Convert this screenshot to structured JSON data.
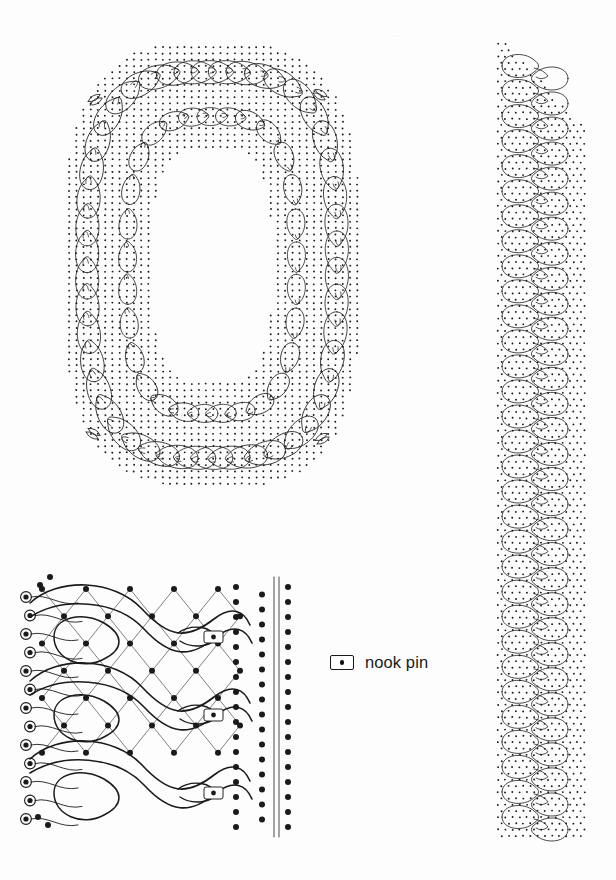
{
  "document": {
    "title": "Bobbin Lace Pricking Pattern",
    "background_color": "#fdfdfd",
    "ink_color": "#1a1a1a",
    "width": 616,
    "height": 880
  },
  "legend": {
    "symbol_name": "nook-pin-symbol",
    "label": "nook pin",
    "x": 330,
    "y": 653
  },
  "figures": [
    {
      "id": "oval-medallion",
      "name": "oval-medallion-pricking",
      "description": "Closed hexagonal-oval lace medallion with looped braid border and dotted pin-pricking ground",
      "bounds": {
        "x": 60,
        "y": 40,
        "width": 305,
        "height": 450
      }
    },
    {
      "id": "edging-strip",
      "name": "straight-edging-pricking",
      "description": "Vertical repeating looped braid edging strip with dotted pin-pricking ground",
      "bounds": {
        "x": 490,
        "y": 40,
        "width": 100,
        "height": 800
      }
    },
    {
      "id": "working-diagram",
      "name": "thread-working-diagram",
      "description": "Enlarged working diagram showing thread paths, hexagonal net, picot loops and nook pins",
      "bounds": {
        "x": 10,
        "y": 570,
        "width": 290,
        "height": 265
      }
    }
  ],
  "faint_mark": {
    "name": "faint-scan-artifact",
    "text": "~",
    "x": 392,
    "y": 30
  },
  "geometry": {
    "oval": {
      "cx": 212,
      "cy": 265,
      "outer_rx": 148,
      "outer_ry": 222,
      "inner_rx": 60,
      "inner_ry": 118,
      "corner_flat": 0.42,
      "loop_count": 46,
      "loop_rx": 22,
      "loop_ry": 13,
      "band_dot_spacing": 7.2,
      "band_thickness": 88
    },
    "strip": {
      "x_left": 498,
      "x_right": 586,
      "y_top": 44,
      "y_bottom": 840,
      "loop_count": 31,
      "loop_rx": 26,
      "loop_ry": 14,
      "dot_spacing": 7.2,
      "diag_top_slope": 1.0
    },
    "working": {
      "x": 18,
      "y": 575,
      "cell_w": 44,
      "cell_h": 44,
      "rows": 6,
      "cols": 5,
      "picot_count": 13,
      "nook_pins": 3,
      "dot_columns": 4,
      "guide_lines": 2
    }
  }
}
